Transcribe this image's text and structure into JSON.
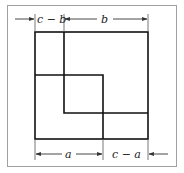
{
  "diagram": {
    "title": "",
    "colors": {
      "stroke": "#111111",
      "frame": "#999999",
      "dim": "#333333",
      "background": "#ffffff"
    },
    "labels": {
      "top_left": "c − b",
      "top_right": "b",
      "bottom_left": "a",
      "bottom_right": "c − a"
    },
    "shapes": [
      {
        "name": "outer-square",
        "side": "c"
      },
      {
        "name": "square-a",
        "side": "a"
      },
      {
        "name": "square-b",
        "side": "b"
      }
    ]
  }
}
